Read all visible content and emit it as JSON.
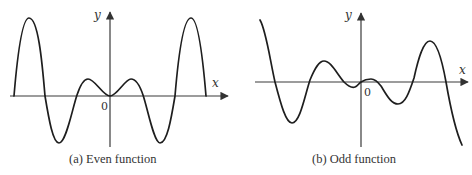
{
  "panels": [
    {
      "id": "a",
      "caption": "(a) Even function",
      "x_axis_label": "x",
      "y_axis_label": "y",
      "origin_label": "0"
    },
    {
      "id": "b",
      "caption": "(b) Odd function",
      "x_axis_label": "x",
      "y_axis_label": "y",
      "origin_label": "0"
    }
  ],
  "colors": {
    "curve": "#1e1e1e",
    "axis": "#3a3a3a",
    "background": "#ffffff"
  }
}
